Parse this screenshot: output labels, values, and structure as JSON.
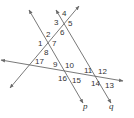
{
  "diagram": {
    "type": "geometry-angles",
    "line_color": "#6a6a6a",
    "text_color": "#333333",
    "lines": [
      {
        "name": "p",
        "label": "p",
        "x1": 29,
        "y1": 10,
        "x2": 83,
        "y2": 103
      },
      {
        "name": "q",
        "label": "q",
        "x1": 56,
        "y1": 10,
        "x2": 111,
        "y2": 103
      },
      {
        "name": "transversal-1",
        "label": "",
        "x1": 10,
        "y1": 88,
        "x2": 79,
        "y2": 6
      },
      {
        "name": "transversal-2",
        "label": "",
        "x1": 1,
        "y1": 60,
        "x2": 123,
        "y2": 81
      }
    ],
    "angle_labels": [
      {
        "n": "1",
        "x": 38,
        "y": 46
      },
      {
        "n": "2",
        "x": 46,
        "y": 37
      },
      {
        "n": "3",
        "x": 54,
        "y": 25
      },
      {
        "n": "4",
        "x": 62,
        "y": 16
      },
      {
        "n": "5",
        "x": 68,
        "y": 26
      },
      {
        "n": "6",
        "x": 60,
        "y": 35
      },
      {
        "n": "7",
        "x": 52,
        "y": 46
      },
      {
        "n": "8",
        "x": 44,
        "y": 55
      },
      {
        "n": "9",
        "x": 53,
        "y": 67
      },
      {
        "n": "10",
        "x": 65,
        "y": 68
      },
      {
        "n": "11",
        "x": 84,
        "y": 73
      },
      {
        "n": "12",
        "x": 98,
        "y": 74
      },
      {
        "n": "13",
        "x": 105,
        "y": 88
      },
      {
        "n": "14",
        "x": 91,
        "y": 86
      },
      {
        "n": "15",
        "x": 72,
        "y": 83
      },
      {
        "n": "16",
        "x": 58,
        "y": 81
      },
      {
        "n": "17",
        "x": 35,
        "y": 64
      }
    ],
    "line_labels": [
      {
        "text": "p",
        "x": 83,
        "y": 109
      },
      {
        "text": "q",
        "x": 109,
        "y": 109
      }
    ]
  }
}
